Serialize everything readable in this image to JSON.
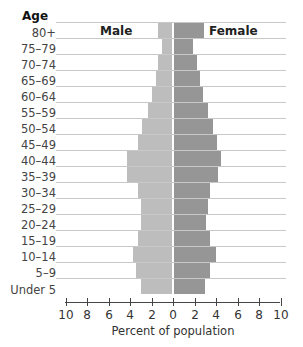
{
  "chart_data": {
    "type": "bar",
    "subtype": "population-pyramid",
    "title": "",
    "ylabel": "Age",
    "xlabel": "Percent of population",
    "xlim": [
      -10,
      10
    ],
    "x_ticks": [
      10,
      8,
      6,
      4,
      2,
      0,
      2,
      4,
      6,
      8,
      10
    ],
    "grid": true,
    "legend": [
      "Male",
      "Female"
    ],
    "categories": [
      "80+",
      "75–79",
      "70–74",
      "65–69",
      "60–64",
      "55–59",
      "50–54",
      "45–49",
      "40–44",
      "35–39",
      "30–34",
      "25–29",
      "20–24",
      "15–19",
      "10–14",
      "5–9",
      "Under 5"
    ],
    "series": [
      {
        "name": "Male",
        "color": "#bdbdbd",
        "values": [
          1.4,
          1.0,
          1.4,
          1.6,
          2.0,
          2.3,
          2.9,
          3.3,
          4.3,
          4.3,
          3.3,
          3.0,
          3.0,
          3.3,
          3.7,
          3.4,
          3.0
        ]
      },
      {
        "name": "Female",
        "color": "#969696",
        "values": [
          2.9,
          1.9,
          2.2,
          2.5,
          2.8,
          3.3,
          3.7,
          4.1,
          4.5,
          4.2,
          3.4,
          3.3,
          3.1,
          3.4,
          4.0,
          3.4,
          3.0
        ]
      }
    ]
  },
  "labels": {
    "age_title": "Age",
    "male": "Male",
    "female": "Female",
    "xlabel": "Percent of population"
  }
}
